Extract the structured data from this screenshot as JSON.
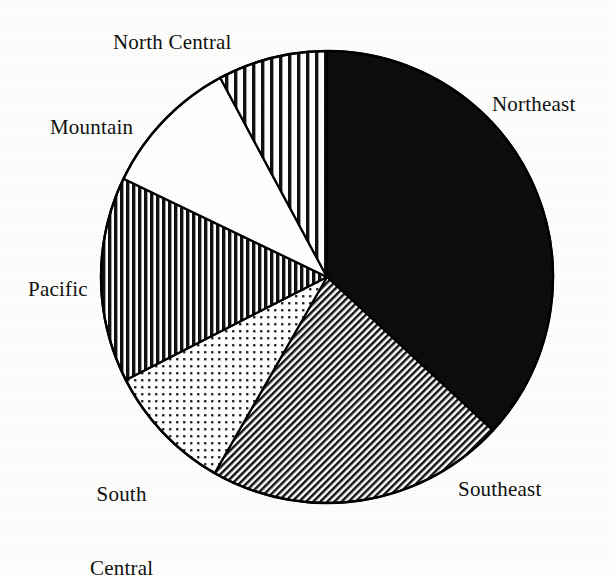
{
  "chart_data": {
    "type": "pie",
    "title": "",
    "subtitle": "",
    "xlabel": "",
    "ylabel": "",
    "legend_position": "none",
    "grid": false,
    "label_style": "outside-callout",
    "start_angle_deg": 0,
    "direction": "clockwise",
    "center": {
      "x": 327,
      "y": 277
    },
    "radius": 226,
    "categories": [
      "Northeast",
      "Southeast",
      "South Central",
      "Pacific",
      "Mountain",
      "North Central"
    ],
    "values": [
      36.9,
      21.4,
      9.2,
      14.7,
      10.0,
      7.8
    ],
    "angles_deg": [
      132.8,
      77.0,
      33.1,
      52.9,
      36.0,
      28.2
    ],
    "slices": [
      {
        "name": "Northeast",
        "label": "Northeast",
        "value": 36.9,
        "start_deg": 0.0,
        "end_deg": 132.8,
        "pattern": "solid-black",
        "fill_color": "#0d0d0d",
        "stroke_color": "#000000",
        "label_x": 492,
        "label_y": 92,
        "label_lines": [
          "Northeast"
        ]
      },
      {
        "name": "Southeast",
        "label": "Southeast",
        "value": 21.4,
        "start_deg": 132.8,
        "end_deg": 209.8,
        "pattern": "diagonal-hatch-fine",
        "fill_color": "#6e6e6e",
        "stroke_color": "#000000",
        "label_x": 458,
        "label_y": 477,
        "label_lines": [
          "Southeast"
        ]
      },
      {
        "name": "South Central",
        "label": "South Central",
        "value": 9.2,
        "start_deg": 209.8,
        "end_deg": 242.9,
        "pattern": "dotted-grid",
        "fill_color": "#c9c9c9",
        "stroke_color": "#000000",
        "label_x": 90,
        "label_y": 432,
        "label_lines": [
          "South",
          "Central"
        ]
      },
      {
        "name": "Pacific",
        "label": "Pacific",
        "value": 14.7,
        "start_deg": 242.9,
        "end_deg": 295.8,
        "pattern": "vertical-stripes-dense",
        "fill_color": "#4a4a4a",
        "stroke_color": "#000000",
        "label_x": 28,
        "label_y": 277,
        "label_lines": [
          "Pacific"
        ]
      },
      {
        "name": "Mountain",
        "label": "Mountain",
        "value": 10.0,
        "start_deg": 295.8,
        "end_deg": 331.8,
        "pattern": "blank-white",
        "fill_color": "#ffffff",
        "stroke_color": "#000000",
        "label_x": 50,
        "label_y": 115,
        "label_lines": [
          "Mountain"
        ]
      },
      {
        "name": "North Central",
        "label": "North Central",
        "value": 7.8,
        "start_deg": 331.8,
        "end_deg": 360.0,
        "pattern": "vertical-stripes-wide",
        "fill_color": "#9a9a9a",
        "stroke_color": "#000000",
        "label_x": 113,
        "label_y": 30,
        "label_lines": [
          "North Central"
        ]
      }
    ]
  },
  "labels": {
    "northeast": "Northeast",
    "southeast": "Southeast",
    "south_central_line1": "South",
    "south_central_line2": "Central",
    "pacific": "Pacific",
    "mountain": "Mountain",
    "north_central": "North Central"
  },
  "colors": {
    "background": "#fdfdfb",
    "outline": "#000000",
    "text": "#111111"
  }
}
